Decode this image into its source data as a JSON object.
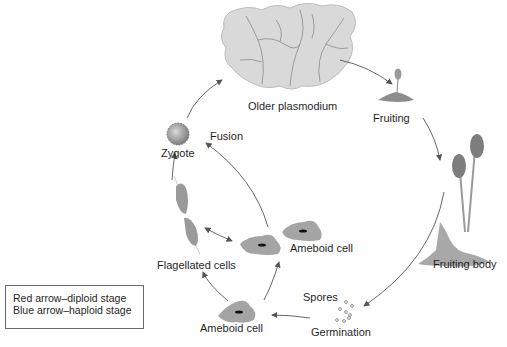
{
  "diagram": {
    "type": "life-cycle",
    "stages": [
      {
        "id": "older-plasmodium",
        "label": "Older plasmodium"
      },
      {
        "id": "fruiting",
        "label": "Fruiting"
      },
      {
        "id": "fruiting-body",
        "label": "Fruiting body"
      },
      {
        "id": "spores",
        "label": "Spores"
      },
      {
        "id": "germination",
        "label": "Germination"
      },
      {
        "id": "ameboid-cell-bottom",
        "label": "Ameboid cell"
      },
      {
        "id": "flagellated-cells",
        "label": "Flagellated cells"
      },
      {
        "id": "ameboid-cell-middle",
        "label": "Ameboid cell"
      },
      {
        "id": "fusion",
        "label": "Fusion"
      },
      {
        "id": "zygote",
        "label": "Zygote"
      }
    ],
    "edges": [
      {
        "from": "older-plasmodium",
        "to": "fruiting"
      },
      {
        "from": "fruiting",
        "to": "fruiting-body"
      },
      {
        "from": "fruiting-body",
        "to": "spores"
      },
      {
        "from": "germination",
        "to": "ameboid-cell-bottom"
      },
      {
        "from": "ameboid-cell-bottom",
        "to": "flagellated-cells"
      },
      {
        "from": "ameboid-cell-bottom",
        "to": "ameboid-cell-middle"
      },
      {
        "from": "flagellated-cells",
        "to": "ameboid-cell-middle",
        "bidirectional": true
      },
      {
        "from": "ameboid-cell-middle",
        "to": "zygote",
        "label": "Fusion"
      },
      {
        "from": "flagellated-cells",
        "to": "zygote"
      },
      {
        "from": "zygote",
        "to": "older-plasmodium"
      }
    ]
  },
  "labels": {
    "older_plasmodium": "Older plasmodium",
    "fruiting": "Fruiting",
    "fruiting_body": "Fruiting body",
    "spores": "Spores",
    "germination": "Germination",
    "ameboid_cell_bottom": "Ameboid cell",
    "ameboid_cell_middle": "Ameboid cell",
    "flagellated_cells": "Flagellated cells",
    "fusion": "Fusion",
    "zygote": "Zygote"
  },
  "legend": {
    "line1": "Red arrow–diploid stage",
    "line2": "Blue arrow–haploid stage"
  },
  "colors": {
    "arrow": "#555555",
    "cell_fill": "#9a9a9a",
    "plasmodium": "#cfcfcf",
    "background": "#ffffff"
  }
}
